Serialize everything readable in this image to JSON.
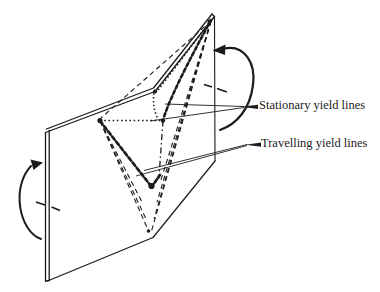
{
  "figure": {
    "type": "technical-line-diagram",
    "labels": {
      "stationary": "Stationary yield lines",
      "travelling": "Travelling yield lines"
    },
    "icons": {
      "left_rotation_arrow": "rotation-arrow-icon",
      "right_rotation_arrow": "rotation-arrow-icon"
    },
    "line_styles": {
      "stationary_yield_lines": "dotted",
      "travelling_yield_lines": "dashed",
      "plate_edges": "solid double line"
    },
    "colors": {
      "ink": "#1c1c1c",
      "background": "#ffffff"
    }
  }
}
